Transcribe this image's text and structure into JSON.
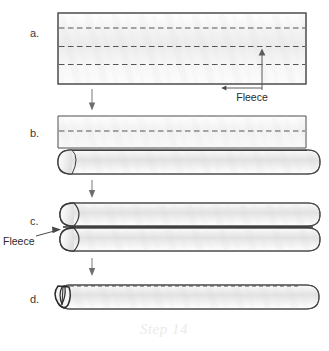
{
  "figure": {
    "caption": "Step 14",
    "background_color": "#ffffff",
    "outline_color": "#4a4a4a",
    "fabric_fill_light": "#fbfbfb",
    "fabric_fill_mid": "#e6e6e6",
    "dashed_line_color": "#555555",
    "arrow_color": "#707070"
  },
  "panels": [
    {
      "id": "a",
      "letter": "a.",
      "description": "Flat rectangle of fleece fabric with three horizontal dashed fold lines",
      "dashed_fold_lines": 3,
      "callout": {
        "label": "Fleece",
        "points_to": "fabric-surface"
      }
    },
    {
      "id": "b",
      "letter": "b.",
      "description": "Top flap still flat with one dashed fold line, bottom edge rolled into a tube with rounded end cap",
      "dashed_fold_lines": 1,
      "callout": null
    },
    {
      "id": "c",
      "letter": "c.",
      "description": "Two stacked rolled fleece tubes with rounded end caps at the left",
      "dashed_fold_lines": 0,
      "callout": {
        "label": "Fleece",
        "points_to": "tube-end-cap"
      }
    },
    {
      "id": "d",
      "letter": "d.",
      "description": "Final single rolled tube with pinched pointed end at the left",
      "dashed_fold_lines": 0,
      "callout": null
    }
  ],
  "arrows": [
    {
      "name": "arrow-a-to-b",
      "direction": "down"
    },
    {
      "name": "arrow-b-to-c",
      "direction": "down"
    },
    {
      "name": "arrow-c-to-d",
      "direction": "down"
    }
  ],
  "labels": {
    "letter_a": "a.",
    "letter_b": "b.",
    "letter_c": "c.",
    "letter_d": "d.",
    "fleece_top": "Fleece",
    "fleece_left": "Fleece",
    "step_caption": "Step 14"
  }
}
